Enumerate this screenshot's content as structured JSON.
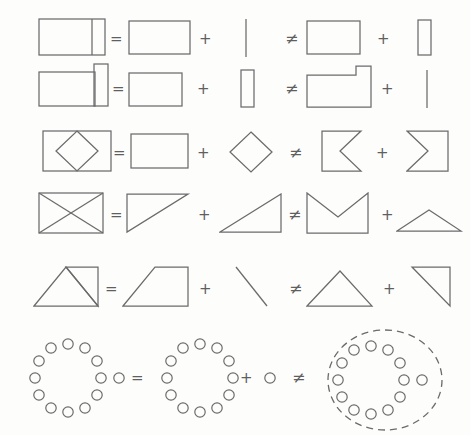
{
  "figure": {
    "background_color": "#fdfdfc",
    "stroke_color": "#6b6b6b",
    "width": 471,
    "height": 435
  },
  "operators": {
    "equals": "=",
    "plus": "+",
    "not_equals": "≠"
  },
  "rows": [
    {
      "id": "row-1",
      "left": {
        "name": "rectangle-with-right-divider",
        "label": "rectangle divided by vertical line near right edge"
      },
      "op1": "=",
      "term1": {
        "name": "plain-rectangle",
        "label": "rectangle"
      },
      "op2": "+",
      "term2": {
        "name": "vertical-line",
        "label": "vertical line segment"
      },
      "op3": "≠",
      "term3": {
        "name": "plain-rectangle",
        "label": "rectangle"
      },
      "op4": "+",
      "term4": {
        "name": "narrow-vertical-rectangle",
        "label": "narrow tall rectangle"
      }
    },
    {
      "id": "row-2",
      "left": {
        "name": "rectangle-with-tall-right-bar",
        "label": "rectangle with taller narrow bar on right"
      },
      "op1": "=",
      "term1": {
        "name": "plain-rectangle",
        "label": "rectangle"
      },
      "op2": "+",
      "term2": {
        "name": "narrow-vertical-rectangle",
        "label": "narrow tall rectangle"
      },
      "op3": "≠",
      "term3": {
        "name": "notched-rectangle",
        "label": "rectangle with step notch at top right"
      },
      "op4": "+",
      "term4": {
        "name": "vertical-line",
        "label": "vertical line segment"
      }
    },
    {
      "id": "row-3",
      "left": {
        "name": "rectangle-with-inscribed-diamond",
        "label": "rectangle containing a diamond"
      },
      "op1": "=",
      "term1": {
        "name": "plain-rectangle",
        "label": "rectangle"
      },
      "op2": "+",
      "term2": {
        "name": "diamond",
        "label": "diamond"
      },
      "op3": "≠",
      "term3": {
        "name": "left-chevron-notch-square",
        "label": "square with chevron notch on right side"
      },
      "op4": "+",
      "term4": {
        "name": "sigma-chevron-shape",
        "label": "square with chevron indent from left side"
      }
    },
    {
      "id": "row-4",
      "left": {
        "name": "rectangle-with-crossed-diagonals",
        "label": "rectangle with both diagonals forming bowtie"
      },
      "op1": "=",
      "term1": {
        "name": "upper-left-triangle",
        "label": "triangle with horizontal top and descending hypotenuse"
      },
      "op2": "+",
      "term2": {
        "name": "lower-right-triangle",
        "label": "triangle with ascending hypotenuse and vertical right edge"
      },
      "op3": "≠",
      "term3": {
        "name": "v-notch-crown-shape",
        "label": "rectangle with V notch cut from top"
      },
      "op4": "+",
      "term4": {
        "name": "flat-triangle",
        "label": "wide flat triangle"
      }
    },
    {
      "id": "row-5",
      "left": {
        "name": "triangle-plus-right-triangle-composite",
        "label": "triangle joined to right triangle with shared diagonal"
      },
      "op1": "=",
      "term1": {
        "name": "trapezoid",
        "label": "trapezoid"
      },
      "op2": "+",
      "term2": {
        "name": "diagonal-line",
        "label": "diagonal line segment"
      },
      "op3": "≠",
      "term3": {
        "name": "isosceles-triangle",
        "label": "isosceles triangle"
      },
      "op4": "+",
      "term4": {
        "name": "right-triangle",
        "label": "right triangle"
      }
    },
    {
      "id": "row-6",
      "left": {
        "name": "circle-ring-with-extra-dot",
        "label": "ring of twelve small circles with one extra circle at right"
      },
      "op1": "=",
      "term1": {
        "name": "circle-ring",
        "label": "ring of twelve small circles"
      },
      "op2": "+",
      "term2": {
        "name": "single-circle",
        "label": "single small circle"
      },
      "op3": "≠",
      "term3": {
        "name": "circle-ring-in-dashed-ellipse",
        "label": "ring of circles plus extra circle enclosed by dashed ellipse"
      },
      "op4": "",
      "term4": {
        "name": "",
        "label": ""
      }
    }
  ],
  "circle_ring": {
    "count": 12,
    "radius_px": 30,
    "dot_radius_px": 5
  }
}
